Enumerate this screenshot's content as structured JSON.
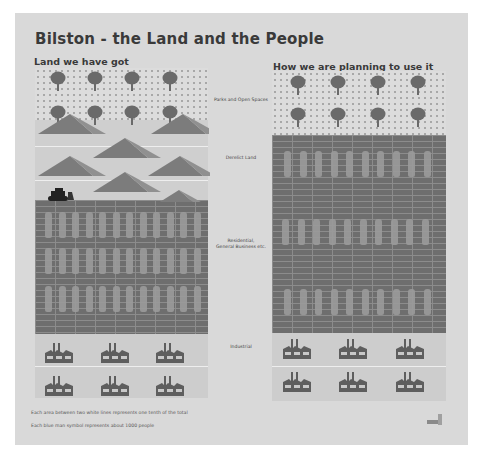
{
  "title": "Bilston - the Land and the People",
  "left_panel": {
    "heading": "Land we have got"
  },
  "right_panel": {
    "heading": "How we are planning to use it"
  },
  "categories": [
    {
      "label": "Parks and Open Spaces",
      "icon": "tree-icon"
    },
    {
      "label": "Derelict Land",
      "icon": "spoil-heap-icon"
    },
    {
      "label_line1": "Residential,",
      "label_line2": "General Business etc.",
      "icon": "person-icon"
    },
    {
      "label": "Industrial",
      "icon": "factory-icon"
    }
  ],
  "notes": [
    "Each area between two white lines represents one tenth of the total",
    "Each blue man symbol represents about 1000 people"
  ],
  "colors": {
    "page": "#d9d9d9",
    "brick": "#6e6e6e",
    "tree": "#6a6a6a",
    "heap": "#7a7a7a",
    "factory": "#5e5e5e"
  },
  "chart_data": {
    "type": "table",
    "title": "Bilston - the Land and the People",
    "unit": "tenths of total land area",
    "columns": [
      "Land we have got",
      "How we are planning to use it"
    ],
    "rows": [
      {
        "category": "Parks and Open Spaces",
        "current": 1.5,
        "planned": 2
      },
      {
        "category": "Derelict Land",
        "current": 2.5,
        "planned": 0
      },
      {
        "category": "Residential, General Business etc.",
        "current": 4,
        "planned": 6
      },
      {
        "category": "Industrial",
        "current": 2,
        "planned": 2
      }
    ],
    "notes": [
      "Each area between two white lines represents one tenth of the total",
      "Each blue man symbol represents about 1000 people"
    ]
  }
}
